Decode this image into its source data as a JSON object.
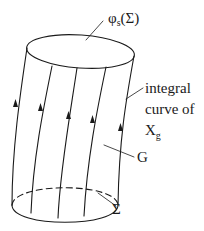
{
  "diagram": {
    "type": "flow-tube",
    "stroke_color": "#1a1a1a",
    "labels": {
      "top_surface": {
        "symbol": "φ",
        "subscript": "s",
        "arg": "(Σ)"
      },
      "integral_curve": {
        "line1": "integral",
        "line2": "curve of",
        "symbol": "X",
        "subscript": "g"
      },
      "tube": "G",
      "base_surface": "Σ"
    },
    "elements": [
      {
        "id": "top-ellipse",
        "represents": "φs(Σ)",
        "style": "solid"
      },
      {
        "id": "bottom-ellipse-front",
        "represents": "Σ",
        "style": "solid"
      },
      {
        "id": "bottom-ellipse-back",
        "represents": "Σ (hidden edge)",
        "style": "dashed"
      },
      {
        "id": "flow-lines",
        "count": 5,
        "arrow_direction": "up"
      }
    ]
  }
}
